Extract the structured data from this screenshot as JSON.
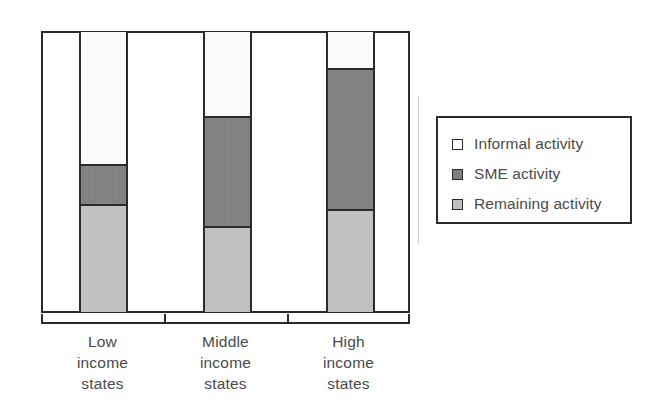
{
  "chart_data": {
    "type": "bar",
    "subtype": "stacked-100-percent",
    "title": "",
    "subtitle": "",
    "xlabel": "",
    "ylabel": "",
    "ylim": [
      0,
      100
    ],
    "grid": false,
    "axis_tick_labels": [],
    "legend_position": "right",
    "categories": [
      "Low income states",
      "Middle income states",
      "High income states"
    ],
    "category_lines": [
      [
        "Low",
        "income",
        "states"
      ],
      [
        "Middle",
        "income",
        "states"
      ],
      [
        "High",
        "income",
        "states"
      ]
    ],
    "series": [
      {
        "name": "Informal activity",
        "color": "#fafafa",
        "values": [
          47,
          30,
          13
        ]
      },
      {
        "name": "SME activity",
        "color": "#808080",
        "values": [
          15,
          40,
          51
        ]
      },
      {
        "name": "Remaining activity",
        "color": "#c0c0c0",
        "values": [
          38,
          30,
          36
        ]
      }
    ],
    "stack_order_top_to_bottom": [
      "Informal activity",
      "SME activity",
      "Remaining activity"
    ]
  },
  "legend": {
    "items": [
      {
        "label": "Informal activity",
        "swatch": "informal",
        "color": "#ffffff"
      },
      {
        "label": "SME activity",
        "swatch": "sme",
        "color": "#808080"
      },
      {
        "label": "Remaining activity",
        "swatch": "remaining",
        "color": "#c0c0c0"
      }
    ]
  },
  "colors": {
    "informal": "#fafafa",
    "sme": "#808080",
    "remaining": "#c0c0c0",
    "outline": "#2b2b2b",
    "text": "#4a4a4a",
    "background": "#ffffff"
  }
}
